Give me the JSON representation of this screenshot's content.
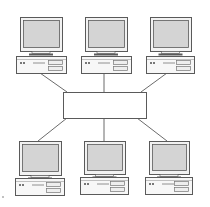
{
  "diagram": {
    "type": "star-network-topology",
    "width": 210,
    "height": 207,
    "colors": {
      "background": "#ffffff",
      "line": "#6b6b6b",
      "outline": "#5a5a5a",
      "screen": "#d4d4d4",
      "bezel": "#f2f2f2",
      "base": "#f7f7f7",
      "stand": "#5a5a5a",
      "hub_fill": "#ffffff"
    },
    "hub": {
      "x": 63,
      "y": 92,
      "w": 83,
      "h": 26,
      "label": ""
    },
    "computers": [
      {
        "id": "pc-top-left",
        "mx": 20,
        "my": 17,
        "mw": 42,
        "mh": 34,
        "bx": 16,
        "by": 56,
        "bw": 50,
        "bh": 17
      },
      {
        "id": "pc-top-center",
        "mx": 85,
        "my": 17,
        "mw": 42,
        "mh": 34,
        "bx": 81,
        "by": 56,
        "bw": 50,
        "bh": 17
      },
      {
        "id": "pc-top-right",
        "mx": 150,
        "my": 17,
        "mw": 41,
        "mh": 34,
        "bx": 146,
        "by": 56,
        "bw": 48,
        "bh": 17
      },
      {
        "id": "pc-bottom-left",
        "mx": 19,
        "my": 141,
        "mw": 42,
        "mh": 34,
        "bx": 15,
        "by": 178,
        "bw": 49,
        "bh": 17
      },
      {
        "id": "pc-bottom-center",
        "mx": 84,
        "my": 141,
        "mw": 41,
        "mh": 33,
        "bx": 80,
        "by": 177,
        "bw": 48,
        "bh": 17
      },
      {
        "id": "pc-bottom-right",
        "mx": 149,
        "my": 141,
        "mw": 40,
        "mh": 33,
        "bx": 145,
        "by": 177,
        "bw": 47,
        "bh": 17
      }
    ],
    "links": [
      {
        "from": "pc-top-left",
        "x1": 40,
        "y1": 73,
        "x2": 67,
        "y2": 92
      },
      {
        "from": "pc-top-center",
        "x1": 104,
        "y1": 73,
        "x2": 104,
        "y2": 92
      },
      {
        "from": "pc-top-right",
        "x1": 167,
        "y1": 73,
        "x2": 141,
        "y2": 92
      },
      {
        "from": "pc-bottom-left",
        "x1": 67,
        "y1": 118,
        "x2": 38,
        "y2": 141
      },
      {
        "from": "pc-bottom-center",
        "x1": 104,
        "y1": 118,
        "x2": 104,
        "y2": 141
      },
      {
        "from": "pc-bottom-right",
        "x1": 137,
        "y1": 118,
        "x2": 167,
        "y2": 141
      }
    ],
    "stray_mark": {
      "x": 3,
      "y": 197
    }
  }
}
